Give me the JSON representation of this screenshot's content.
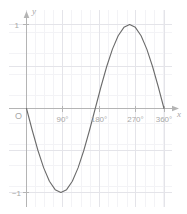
{
  "chart_data": {
    "type": "line",
    "title": "",
    "xlabel": "x",
    "ylabel": "y",
    "origin_label": "O",
    "xlim": [
      0,
      360
    ],
    "ylim": [
      -1,
      1
    ],
    "grid": true,
    "legend": "none",
    "x_tick_labels": [
      "90°",
      "180°",
      "270°",
      "360°"
    ],
    "x_tick_values": [
      90,
      180,
      270,
      360
    ],
    "y_tick_labels": [
      "1",
      "−1"
    ],
    "y_tick_values": [
      1,
      -1
    ],
    "series": [
      {
        "name": "y = -sin(x)",
        "x": [
          0,
          15,
          30,
          45,
          60,
          75,
          90,
          105,
          120,
          135,
          150,
          165,
          180,
          195,
          210,
          225,
          240,
          255,
          270,
          285,
          300,
          315,
          330,
          345,
          360
        ],
        "values": [
          0,
          -0.259,
          -0.5,
          -0.707,
          -0.866,
          -0.966,
          -1,
          -0.966,
          -0.866,
          -0.707,
          -0.5,
          -0.259,
          0,
          0.259,
          0.5,
          0.707,
          0.866,
          0.966,
          1,
          0.966,
          0.866,
          0.707,
          0.5,
          0.259,
          0
        ]
      }
    ]
  },
  "style": {
    "curve_color": "#6b6b6b",
    "axis_color": "#b4b4b4",
    "grid_major_color": "#e6e6ea",
    "grid_minor_color": "#f2f2f5",
    "label_color": "#a8a8a8",
    "background": "#ffffff"
  }
}
